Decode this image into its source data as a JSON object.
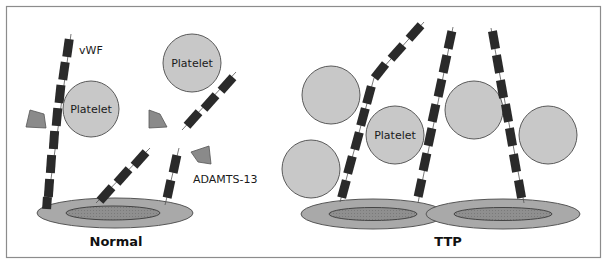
{
  "figure": {
    "panels": [
      {
        "id": "normal",
        "caption": "Normal",
        "labels": {
          "vwf": "vWF",
          "platelet_1": "Platelet",
          "platelet_2": "Platelet",
          "enzyme": "ADAMTS-13"
        }
      },
      {
        "id": "ttp",
        "caption": "TTP",
        "labels": {
          "platelet": "Platelet"
        }
      }
    ],
    "colors": {
      "frame": "#8c8c8c",
      "platelet_fill": "#c8c8c8",
      "platelet_stroke": "#5a5a5a",
      "vwf_segment": "#2a2a2a",
      "enzyme_fill": "#8a8a8a",
      "cell_outer": "#a9a9a9",
      "cell_inner": "#8f8f8f"
    }
  }
}
